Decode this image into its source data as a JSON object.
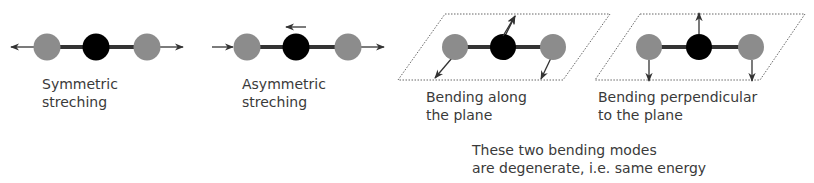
{
  "modes": [
    {
      "id": "symmetric",
      "label_line1": "Symmetric",
      "label_line2": "streching"
    },
    {
      "id": "asymmetric",
      "label_line1": "Asymmetric",
      "label_line2": "streching"
    },
    {
      "id": "bend-plane",
      "label_line1": "Bending along",
      "label_line2": "the plane"
    },
    {
      "id": "bend-perp",
      "label_line1": "Bending perpendicular",
      "label_line2": "to the plane"
    }
  ],
  "note": {
    "line1": "These two bending modes",
    "line2": "are degenerate, i.e. same energy"
  },
  "colors": {
    "outer_atom": "#8c8c8c",
    "center_atom": "#000000",
    "bond": "#333333",
    "plane": "#666666"
  }
}
